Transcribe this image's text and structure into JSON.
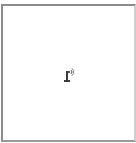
{
  "header": {
    "cutoff_text": "— — — — — — — —"
  },
  "panel": {
    "icon": "antenna-broadcast-icon",
    "border_color": "#8c8c8c",
    "background": "#ffffff"
  }
}
